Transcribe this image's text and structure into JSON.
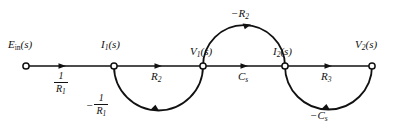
{
  "figure": {
    "kind": "signal-flow-graph",
    "width": 394,
    "height": 129,
    "background": "#ffffff",
    "line_color": "#111111",
    "text_color": "#111111"
  },
  "nodes": [
    {
      "id": "ein",
      "label_prefix": "E",
      "label_sub": "in",
      "label_suffix": "(s)",
      "label_text": "Eₒₙ(s)",
      "x": 26,
      "y": 66
    },
    {
      "id": "i1",
      "label_prefix": "I",
      "label_sub": "1",
      "label_suffix": "(s)",
      "label_text": "I₁(s)",
      "x": 114,
      "y": 66
    },
    {
      "id": "v1",
      "label_prefix": "V",
      "label_sub": "1",
      "label_suffix": "(s)",
      "label_text": "V₁(s)",
      "x": 203,
      "y": 66
    },
    {
      "id": "i2",
      "label_prefix": "I",
      "label_sub": "2",
      "label_suffix": "(s)",
      "label_text": "I₂(s)",
      "x": 285,
      "y": 66
    },
    {
      "id": "v2",
      "label_prefix": "V",
      "label_sub": "2",
      "label_suffix": "(s)",
      "label_text": "V₂(s)",
      "x": 372,
      "y": 66
    }
  ],
  "branches": [
    {
      "id": "b1",
      "from": "ein",
      "to": "i1",
      "gain_text": "1/R₁",
      "gain_kind": "fraction",
      "numerator": "1",
      "denominator_base": "R",
      "denominator_sub": "1",
      "sign": "",
      "shape": "straight",
      "direction": "right"
    },
    {
      "id": "b2",
      "from": "i1",
      "to": "v1",
      "gain_text": "R₂",
      "gain_kind": "simple",
      "base": "R",
      "sub": "2",
      "sign": "",
      "shape": "straight",
      "direction": "right"
    },
    {
      "id": "b3",
      "from": "v1",
      "to": "i2",
      "gain_text": "Cₛ",
      "gain_kind": "simple",
      "base": "C",
      "sub": "s",
      "sign": "",
      "shape": "straight",
      "direction": "right"
    },
    {
      "id": "b4",
      "from": "i2",
      "to": "v2",
      "gain_text": "R₃",
      "gain_kind": "simple",
      "base": "R",
      "sub": "3",
      "sign": "",
      "shape": "straight",
      "direction": "right"
    },
    {
      "id": "b5",
      "from": "v1",
      "to": "i2",
      "gain_text": "−R₂",
      "gain_kind": "simple",
      "base": "R",
      "sub": "2",
      "sign": "−",
      "shape": "arc-above",
      "direction": "right"
    },
    {
      "id": "b6",
      "from": "v1",
      "to": "i1",
      "gain_text": "−1/R₁",
      "gain_kind": "fraction",
      "numerator": "1",
      "denominator_base": "R",
      "denominator_sub": "1",
      "sign": "−",
      "shape": "arc-below",
      "direction": "left"
    },
    {
      "id": "b7",
      "from": "v2",
      "to": "i2",
      "gain_text": "−Cₛ",
      "gain_kind": "simple",
      "base": "C",
      "sub": "s",
      "sign": "−",
      "shape": "arc-below",
      "direction": "left"
    }
  ],
  "labels": {
    "node_ein_base": "E",
    "node_ein_sub": "in",
    "node_ein_tail": "(s)",
    "node_i1_base": "I",
    "node_i1_sub": "1",
    "node_i1_tail": "(s)",
    "node_v1_base": "V",
    "node_v1_sub": "1",
    "node_v1_tail": "(s)",
    "node_i2_base": "I",
    "node_i2_sub": "2",
    "node_i2_tail": "(s)",
    "node_v2_base": "V",
    "node_v2_sub": "2",
    "node_v2_tail": "(s)",
    "gain_b1_num": "1",
    "gain_b1_den_base": "R",
    "gain_b1_den_sub": "1",
    "gain_b2_base": "R",
    "gain_b2_sub": "2",
    "gain_b3_base": "C",
    "gain_b3_sub": "s",
    "gain_b4_base": "R",
    "gain_b4_sub": "3",
    "gain_b5_sign": "−",
    "gain_b5_base": "R",
    "gain_b5_sub": "2",
    "gain_b6_sign": "−",
    "gain_b6_num": "1",
    "gain_b6_den_base": "R",
    "gain_b6_den_sub": "1",
    "gain_b7_sign": "−",
    "gain_b7_base": "C",
    "gain_b7_sub": "s"
  }
}
